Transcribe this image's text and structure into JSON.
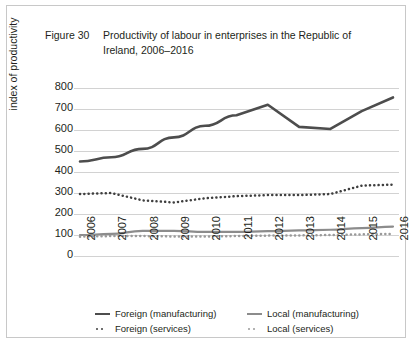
{
  "figure": {
    "label": "Figure 30",
    "title": "Productivity of labour in enterprises in the Republic of Ireland, 2006–2016"
  },
  "colors": {
    "foreign_manufacturing": "#4d4d4d",
    "foreign_services": "#3f3f3f",
    "local_manufacturing": "#8c8c8c",
    "local_services": "#9a9a9a",
    "gridline": "#d2d2d2",
    "text": "#231f20",
    "border": "#c8c8c8"
  },
  "chart_data": {
    "type": "line",
    "title": "Productivity of labour in enterprises in the Republic of Ireland, 2006–2016",
    "xlabel": "",
    "ylabel": "index of productivity",
    "categories": [
      "2006",
      "2007",
      "2008",
      "2009",
      "2010",
      "2011",
      "2012",
      "2013",
      "2014",
      "2015",
      "2016"
    ],
    "ylim": [
      0,
      800
    ],
    "yticks": [
      0,
      100,
      200,
      300,
      400,
      500,
      600,
      700,
      800
    ],
    "grid": true,
    "legend_position": "bottom",
    "series": [
      {
        "name": "Foreign (manufacturing)",
        "style": "solid",
        "color": "#4d4d4d",
        "values": [
          450,
          470,
          510,
          565,
          620,
          670,
          720,
          615,
          605,
          690,
          755
        ]
      },
      {
        "name": "Local (manufacturing)",
        "style": "solid",
        "color": "#8c8c8c",
        "values": [
          100,
          105,
          120,
          120,
          115,
          115,
          118,
          122,
          125,
          133,
          140
        ]
      },
      {
        "name": "Foreign (services)",
        "style": "dotted",
        "color": "#3f3f3f",
        "values": [
          295,
          300,
          265,
          255,
          275,
          285,
          290,
          290,
          295,
          335,
          340
        ]
      },
      {
        "name": "Local (services)",
        "style": "dotted",
        "color": "#9a9a9a",
        "values": [
          92,
          95,
          95,
          93,
          93,
          95,
          97,
          98,
          100,
          103,
          105
        ]
      }
    ]
  },
  "legend": {
    "items": [
      {
        "label": "Foreign (manufacturing)",
        "style": "solid",
        "color": "#4d4d4d"
      },
      {
        "label": "Local (manufacturing)",
        "style": "solid",
        "color": "#8c8c8c"
      },
      {
        "label": "Foreign (services)",
        "style": "dotted",
        "color": "#3f3f3f"
      },
      {
        "label": "Local (services)",
        "style": "dotted",
        "color": "#9a9a9a"
      }
    ]
  }
}
